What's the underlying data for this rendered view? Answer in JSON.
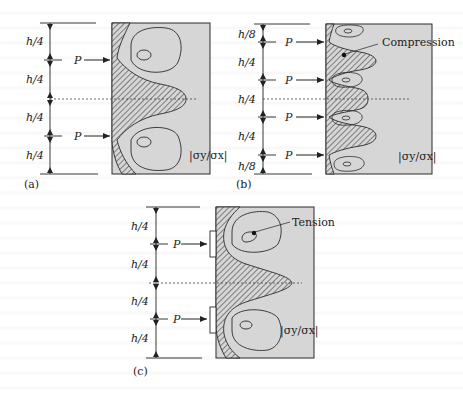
{
  "figure": {
    "panels": [
      {
        "id": "a",
        "caption": "(a)",
        "dimensions": [
          "h/4",
          "h/4",
          "h/4",
          "h/4"
        ],
        "loads": [
          "P",
          "P"
        ],
        "legend": "|σy/σx|"
      },
      {
        "id": "b",
        "caption": "(b)",
        "dimensions": [
          "h/8",
          "h/4",
          "h/4",
          "h/4",
          "h/8"
        ],
        "loads": [
          "P",
          "P",
          "P",
          "P"
        ],
        "legend": "|σy/σx|",
        "annotation": "Compression"
      },
      {
        "id": "c",
        "caption": "(c)",
        "dimensions": [
          "h/4",
          "h/4",
          "h/4",
          "h/4"
        ],
        "loads": [
          "P",
          "P"
        ],
        "legend": "|σy/σx|",
        "annotation": "Tension"
      }
    ],
    "colors": {
      "region_fill": "#d6d6d6",
      "line": "#2a2a2a",
      "hatch": "#333333"
    }
  }
}
